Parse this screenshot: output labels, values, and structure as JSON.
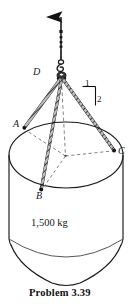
{
  "figure": {
    "title": "Problem 3.39",
    "type": "engineering-statics-free-body-diagram",
    "labels": {
      "point_d": "D",
      "point_a": "A",
      "point_b": "B",
      "point_c": "C",
      "slope_run": "1",
      "slope_rise": "2",
      "mass": "1,500 kg"
    },
    "caption": "Problem  3.39",
    "colors": {
      "line": "#1a1a1a",
      "dashed": "#555555",
      "background": "#ffffff",
      "cable": "#2b2b2b"
    },
    "geometry": {
      "arrow_top_y": 8,
      "hook_point_d": [
        61,
        78
      ],
      "point_a": [
        24,
        128
      ],
      "point_b": [
        41,
        190
      ],
      "point_c": [
        114,
        151
      ],
      "ellipse_center": [
        66,
        155
      ],
      "ellipse_rx": 57,
      "ellipse_ry": 33,
      "cylinder_bottom_y": 245,
      "cone_tip_y": 285
    }
  }
}
